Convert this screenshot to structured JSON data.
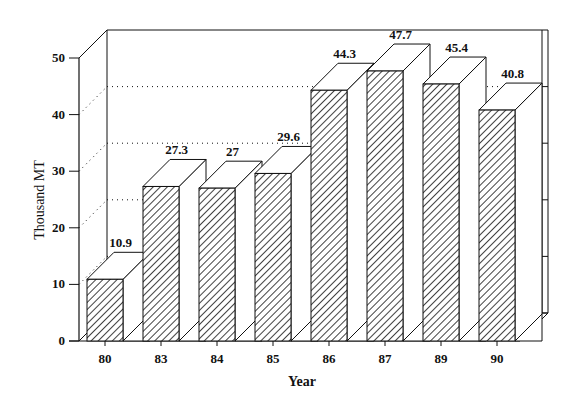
{
  "chart_data": {
    "type": "bar",
    "style": "3d-bar",
    "title": "",
    "xlabel": "Year",
    "ylabel": "Thousand MT",
    "categories": [
      "80",
      "83",
      "84",
      "85",
      "86",
      "87",
      "89",
      "90"
    ],
    "values": [
      10.9,
      27.3,
      27,
      29.6,
      44.3,
      47.7,
      45.4,
      40.8
    ],
    "data_labels": [
      "10.9",
      "27.3",
      "27",
      "29.6",
      "44.3",
      "47.7",
      "45.4",
      "40.8"
    ],
    "yticks": [
      0,
      10,
      20,
      30,
      40,
      50
    ],
    "ylim": [
      0,
      50
    ],
    "grid": "dotted horizontal on back wall",
    "legend": null,
    "bar_fill": "diagonal hatch",
    "colors": {
      "line": "#111111",
      "background": "#ffffff",
      "hatch": "#111111"
    }
  }
}
